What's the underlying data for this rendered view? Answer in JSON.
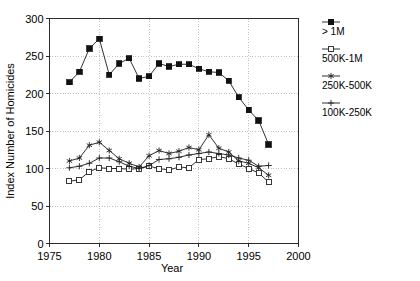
{
  "chart_data": {
    "type": "line",
    "title": "",
    "xlabel": "Year",
    "ylabel": "Index Number of Homicides",
    "xlim": [
      1975,
      2000
    ],
    "ylim": [
      0,
      300
    ],
    "xticks": [
      1975,
      1980,
      1985,
      1990,
      1995,
      2000
    ],
    "yticks": [
      0,
      50,
      100,
      150,
      200,
      250,
      300
    ],
    "xtick_labels": [
      "1975",
      "1980",
      "1985",
      "1990",
      "1995",
      "2000"
    ],
    "ytick_labels": [
      "0",
      "50",
      "100",
      "150",
      "200",
      "250",
      "300"
    ],
    "grid": true,
    "legend_position": "right",
    "x": [
      1977,
      1978,
      1979,
      1980,
      1981,
      1982,
      1983,
      1984,
      1985,
      1986,
      1987,
      1988,
      1989,
      1990,
      1991,
      1992,
      1993,
      1994,
      1995,
      1996,
      1997
    ],
    "series": [
      {
        "name": "> 1M",
        "marker": "filled-square",
        "values": [
          215,
          229,
          260,
          273,
          225,
          240,
          247,
          220,
          223,
          240,
          236,
          239,
          239,
          233,
          229,
          228,
          217,
          195,
          178,
          164,
          132
        ]
      },
      {
        "name": "500K-1M",
        "marker": "open-square",
        "values": [
          83,
          85,
          96,
          101,
          100,
          100,
          99,
          100,
          103,
          100,
          98,
          102,
          101,
          112,
          113,
          116,
          113,
          106,
          100,
          94,
          82
        ]
      },
      {
        "name": "250K-500K",
        "marker": "star",
        "values": [
          110,
          114,
          131,
          135,
          124,
          113,
          107,
          102,
          117,
          124,
          120,
          123,
          128,
          125,
          145,
          127,
          122,
          110,
          107,
          101,
          91
        ]
      },
      {
        "name": "100K-250K",
        "marker": "plus",
        "values": [
          101,
          103,
          107,
          114,
          114,
          109,
          103,
          100,
          104,
          112,
          113,
          115,
          118,
          120,
          122,
          120,
          118,
          114,
          111,
          103,
          104
        ]
      }
    ]
  },
  "legend": {
    "items": [
      {
        "label": "> 1M",
        "marker": "filled-square"
      },
      {
        "label": "500K-1M",
        "marker": "open-square"
      },
      {
        "label": "250K-500K",
        "marker": "star"
      },
      {
        "label": "100K-250K",
        "marker": "plus"
      }
    ]
  },
  "axes": {
    "x_title": "Year",
    "y_title": "Index Number of Homicides"
  },
  "colors": {
    "line": "#1a1a1a",
    "grid": "#9a9a9a",
    "frame": "#2b2b2b",
    "background": "#ffffff"
  }
}
